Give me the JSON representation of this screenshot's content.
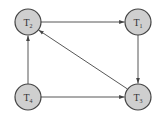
{
  "diagram": {
    "type": "directed-graph",
    "colors": {
      "node_fill": "#cfcfcf",
      "node_stroke": "#444444",
      "edge": "#444444"
    },
    "nodes": [
      {
        "id": "T2",
        "label": "T",
        "subscript": "2",
        "x": 28,
        "y": 22
      },
      {
        "id": "T1",
        "label": "T",
        "subscript": "1",
        "x": 138,
        "y": 22
      },
      {
        "id": "T4",
        "label": "T",
        "subscript": "4",
        "x": 28,
        "y": 97
      },
      {
        "id": "T3",
        "label": "T",
        "subscript": "3",
        "x": 138,
        "y": 97
      }
    ],
    "edges": [
      {
        "from": "T2",
        "to": "T1"
      },
      {
        "from": "T1",
        "to": "T3"
      },
      {
        "from": "T3",
        "to": "T2"
      },
      {
        "from": "T4",
        "to": "T2"
      },
      {
        "from": "T4",
        "to": "T3"
      }
    ]
  }
}
